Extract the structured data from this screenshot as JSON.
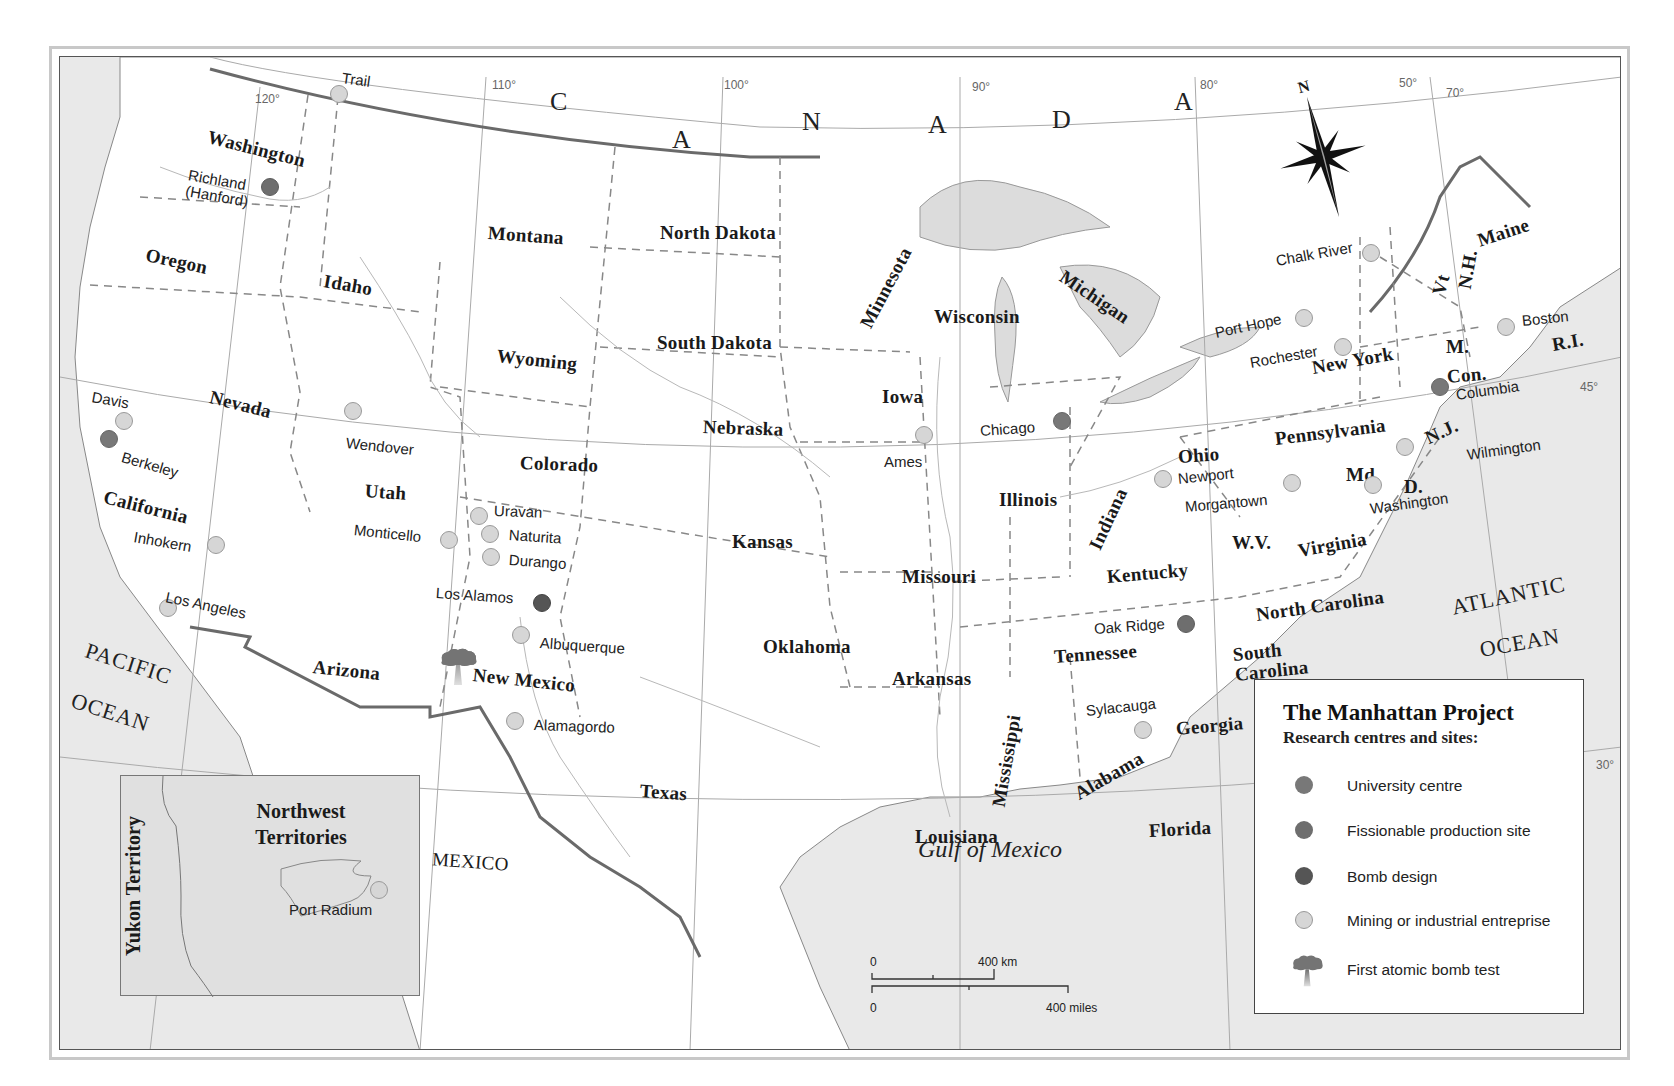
{
  "map": {
    "canada_letters": [
      {
        "text": "C",
        "x": 490,
        "y": 32
      },
      {
        "text": "A",
        "x": 612,
        "y": 70
      },
      {
        "text": "N",
        "x": 742,
        "y": 52
      },
      {
        "text": "A",
        "x": 868,
        "y": 55
      },
      {
        "text": "D",
        "x": 992,
        "y": 50
      },
      {
        "text": "A",
        "x": 1114,
        "y": 32
      }
    ],
    "longitudes": [
      {
        "label": "120°",
        "x": 195,
        "y": 36
      },
      {
        "label": "110°",
        "x": 432,
        "y": 22
      },
      {
        "label": "100°",
        "x": 664,
        "y": 22
      },
      {
        "label": "90°",
        "x": 912,
        "y": 24
      },
      {
        "label": "80°",
        "x": 1140,
        "y": 22
      },
      {
        "label": "70°",
        "x": 1386,
        "y": 30
      },
      {
        "label": "50°",
        "x": 1339,
        "y": 20
      },
      {
        "label": "45°",
        "x": 1520,
        "y": 324
      },
      {
        "label": "30°",
        "x": 1536,
        "y": 702
      }
    ],
    "states": [
      {
        "name": "Washington",
        "x": 148,
        "y": 70,
        "rot": 14
      },
      {
        "name": "Oregon",
        "x": 86,
        "y": 188,
        "rot": 12
      },
      {
        "name": "Idaho",
        "x": 264,
        "y": 214,
        "rot": 10
      },
      {
        "name": "Montana",
        "x": 428,
        "y": 166,
        "rot": 4
      },
      {
        "name": "North Dakota",
        "x": 600,
        "y": 166,
        "rot": 0
      },
      {
        "name": "Minnesota",
        "x": 805,
        "y": 260,
        "rot": -62
      },
      {
        "name": "Wisconsin",
        "x": 874,
        "y": 250,
        "rot": 0
      },
      {
        "name": "Michigan",
        "x": 1002,
        "y": 208,
        "rot": 34
      },
      {
        "name": "South Dakota",
        "x": 597,
        "y": 276,
        "rot": 0
      },
      {
        "name": "Wyoming",
        "x": 437,
        "y": 289,
        "rot": 6
      },
      {
        "name": "Nevada",
        "x": 150,
        "y": 330,
        "rot": 14
      },
      {
        "name": "Iowa",
        "x": 822,
        "y": 330,
        "rot": 0
      },
      {
        "name": "Nebraska",
        "x": 643,
        "y": 360,
        "rot": 2
      },
      {
        "name": "Colorado",
        "x": 460,
        "y": 396,
        "rot": 2
      },
      {
        "name": "Utah",
        "x": 305,
        "y": 424,
        "rot": 4
      },
      {
        "name": "California",
        "x": 44,
        "y": 430,
        "rot": 14
      },
      {
        "name": "Illinois",
        "x": 939,
        "y": 433,
        "rot": 0
      },
      {
        "name": "Indiana",
        "x": 1034,
        "y": 482,
        "rot": -65
      },
      {
        "name": "Ohio",
        "x": 1118,
        "y": 390,
        "rot": -4
      },
      {
        "name": "Pennsylvania",
        "x": 1215,
        "y": 372,
        "rot": -7
      },
      {
        "name": "New York",
        "x": 1252,
        "y": 301,
        "rot": -10
      },
      {
        "name": "Kansas",
        "x": 672,
        "y": 475,
        "rot": 0
      },
      {
        "name": "Missouri",
        "x": 842,
        "y": 510,
        "rot": 0
      },
      {
        "name": "Kentucky",
        "x": 1047,
        "y": 510,
        "rot": -5
      },
      {
        "name": "W.V.",
        "x": 1172,
        "y": 476,
        "rot": 0
      },
      {
        "name": "Virginia",
        "x": 1238,
        "y": 484,
        "rot": -10
      },
      {
        "name": "Md",
        "x": 1286,
        "y": 408,
        "rot": 0
      },
      {
        "name": "D.",
        "x": 1344,
        "y": 420,
        "rot": 0
      },
      {
        "name": "N.J.",
        "x": 1366,
        "y": 372,
        "rot": -25
      },
      {
        "name": "Con.",
        "x": 1387,
        "y": 310,
        "rot": -5
      },
      {
        "name": "M.",
        "x": 1386,
        "y": 280,
        "rot": 0
      },
      {
        "name": "R.I.",
        "x": 1492,
        "y": 278,
        "rot": -10
      },
      {
        "name": "Vt",
        "x": 1378,
        "y": 228,
        "rot": -75
      },
      {
        "name": "N.H.",
        "x": 1404,
        "y": 222,
        "rot": -80
      },
      {
        "name": "Maine",
        "x": 1418,
        "y": 174,
        "rot": -18
      },
      {
        "name": "North Carolina",
        "x": 1196,
        "y": 548,
        "rot": -8
      },
      {
        "name": "South\nCarolina",
        "x": 1174,
        "y": 588,
        "rot": -6
      },
      {
        "name": "Tennessee",
        "x": 994,
        "y": 590,
        "rot": -4
      },
      {
        "name": "Oklahoma",
        "x": 703,
        "y": 580,
        "rot": 0
      },
      {
        "name": "Arkansas",
        "x": 832,
        "y": 612,
        "rot": 0
      },
      {
        "name": "Arizona",
        "x": 253,
        "y": 600,
        "rot": 6
      },
      {
        "name": "New Mexico",
        "x": 413,
        "y": 608,
        "rot": 6
      },
      {
        "name": "Texas",
        "x": 580,
        "y": 724,
        "rot": 4
      },
      {
        "name": "Mississippi",
        "x": 938,
        "y": 740,
        "rot": -80
      },
      {
        "name": "Alabama",
        "x": 1016,
        "y": 728,
        "rot": -30
      },
      {
        "name": "Georgia",
        "x": 1116,
        "y": 662,
        "rot": -5
      },
      {
        "name": "Louisiana",
        "x": 855,
        "y": 770,
        "rot": 0
      },
      {
        "name": "Florida",
        "x": 1089,
        "y": 764,
        "rot": -3
      }
    ],
    "oceans": [
      {
        "name": "PACIFIC",
        "x": 26,
        "y": 582,
        "rot": 18
      },
      {
        "name": "OCEAN",
        "x": 12,
        "y": 632,
        "rot": 18
      },
      {
        "name": "ATLANTIC",
        "x": 1392,
        "y": 540,
        "rot": -12
      },
      {
        "name": "OCEAN",
        "x": 1420,
        "y": 582,
        "rot": -10
      }
    ],
    "gulf": {
      "name": "Gulf of Mexico",
      "x": 917,
      "y": 840
    },
    "country_mexico": {
      "name": "MEXICO",
      "x": 400,
      "y": 852,
      "rot": 4
    },
    "sites": [
      {
        "name": "Trail",
        "type": "mining",
        "x": 279,
        "y": 37,
        "lx": 282,
        "ly": 13,
        "rot": 8
      },
      {
        "name": "Richland\n(Hanford)",
        "type": "fission",
        "x": 210,
        "y": 130,
        "lx": 127,
        "ly": 110,
        "rot": 10
      },
      {
        "name": "Davis",
        "type": "mining",
        "x": 64,
        "y": 364,
        "lx": 32,
        "ly": 332,
        "rot": 10
      },
      {
        "name": "Berkeley",
        "type": "university",
        "x": 49,
        "y": 382,
        "lx": 62,
        "ly": 392,
        "rot": 16
      },
      {
        "name": "Inhokern",
        "type": "mining",
        "x": 156,
        "y": 488,
        "lx": 74,
        "ly": 472,
        "rot": 10
      },
      {
        "name": "Los Angeles",
        "type": "mining",
        "x": 108,
        "y": 551,
        "lx": 106,
        "ly": 532,
        "rot": 12
      },
      {
        "name": "Wendover",
        "type": "mining",
        "x": 293,
        "y": 354,
        "lx": 286,
        "ly": 378,
        "rot": 6
      },
      {
        "name": "Monticello",
        "type": "mining",
        "x": 389,
        "y": 483,
        "lx": 294,
        "ly": 465,
        "rot": 6
      },
      {
        "name": "Uravan",
        "type": "mining",
        "x": 419,
        "y": 459,
        "lx": 434,
        "ly": 446,
        "rot": 2
      },
      {
        "name": "Naturita",
        "type": "mining",
        "x": 430,
        "y": 477,
        "lx": 449,
        "ly": 470,
        "rot": 4
      },
      {
        "name": "Durango",
        "type": "mining",
        "x": 431,
        "y": 500,
        "lx": 449,
        "ly": 495,
        "rot": 4
      },
      {
        "name": "Los Alamos",
        "type": "bomb",
        "x": 482,
        "y": 546,
        "lx": 376,
        "ly": 528,
        "rot": 4
      },
      {
        "name": "Albuquerque",
        "type": "mining",
        "x": 461,
        "y": 578,
        "lx": 480,
        "ly": 578,
        "rot": 4
      },
      {
        "name": "Alamagordo",
        "type": "mining",
        "x": 455,
        "y": 664,
        "lx": 474,
        "ly": 660,
        "rot": 2
      },
      {
        "name": "Ames",
        "type": "mining",
        "x": 864,
        "y": 378,
        "lx": 824,
        "ly": 397,
        "rot": 0
      },
      {
        "name": "Chicago",
        "type": "university",
        "x": 1002,
        "y": 364,
        "lx": 920,
        "ly": 366,
        "rot": -4
      },
      {
        "name": "Newport",
        "type": "mining",
        "x": 1103,
        "y": 422,
        "lx": 1118,
        "ly": 414,
        "rot": -6
      },
      {
        "name": "Morgantown",
        "type": "mining",
        "x": 1232,
        "y": 426,
        "lx": 1125,
        "ly": 442,
        "rot": -5
      },
      {
        "name": "Washington",
        "type": "mining",
        "x": 1313,
        "y": 428,
        "lx": 1310,
        "ly": 444,
        "rot": -8
      },
      {
        "name": "Wilmington",
        "type": "mining",
        "x": 1345,
        "y": 390,
        "lx": 1407,
        "ly": 390,
        "rot": -8
      },
      {
        "name": "Columbia",
        "type": "university",
        "x": 1380,
        "y": 330,
        "lx": 1396,
        "ly": 330,
        "rot": -8
      },
      {
        "name": "Boston",
        "type": "mining",
        "x": 1446,
        "y": 270,
        "lx": 1462,
        "ly": 256,
        "rot": -6
      },
      {
        "name": "Chalk River",
        "type": "mining",
        "x": 1311,
        "y": 196,
        "lx": 1216,
        "ly": 196,
        "rot": -10
      },
      {
        "name": "Port Hope",
        "type": "mining",
        "x": 1244,
        "y": 261,
        "lx": 1155,
        "ly": 268,
        "rot": -12
      },
      {
        "name": "Rochester",
        "type": "mining",
        "x": 1283,
        "y": 290,
        "lx": 1190,
        "ly": 298,
        "rot": -10
      },
      {
        "name": "Oak Ridge",
        "type": "fission",
        "x": 1126,
        "y": 567,
        "lx": 1034,
        "ly": 564,
        "rot": -4
      },
      {
        "name": "Sylacauga",
        "type": "mining",
        "x": 1083,
        "y": 673,
        "lx": 1026,
        "ly": 646,
        "rot": -6
      }
    ],
    "bomb_test": {
      "x": 436,
      "y": 630
    },
    "inset": {
      "title_line1": "Northwest",
      "title_line2": "Territories",
      "side_label": "Yukon Territory",
      "site": {
        "name": "Port Radium",
        "type": "mining"
      }
    },
    "scale": {
      "km_zero": "0",
      "km_label": "400 km",
      "mi_zero": "0",
      "mi_label": "400 miles"
    },
    "compass": {
      "label": "N"
    }
  },
  "legend": {
    "title": "The Manhattan Project",
    "subtitle": "Research centres and sites:",
    "items": [
      {
        "label": "University centre",
        "color": "#787878"
      },
      {
        "label": "Fissionable production site",
        "color": "#6e6e6e"
      },
      {
        "label": "Bomb design",
        "color": "#555555"
      },
      {
        "label": "Mining or industrial entreprise",
        "color": "#d6d6d6"
      },
      {
        "label": "First atomic bomb test",
        "color": "#7a7a7a"
      }
    ]
  },
  "colors": {
    "land": "#ffffff",
    "water": "#e6e6e6",
    "border": "#666666",
    "state_line": "#888888"
  }
}
